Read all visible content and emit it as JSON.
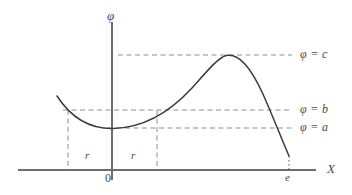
{
  "figure": {
    "background_color": "#ffffff",
    "curve_color": "#3a3a3a",
    "axis_color": "#6d6d6d",
    "guide_color": "#8e8e8e",
    "text_color": "#4a4a4a",
    "width": 352,
    "height": 195
  },
  "axes": {
    "y_axis_label": "φ",
    "x_axis_label": "X",
    "origin_label": "0",
    "x_axis_y": 170,
    "y_axis_x": 112,
    "x_axis_start": 18,
    "x_axis_end": 316,
    "y_axis_top": 22,
    "y_axis_bottom": 180
  },
  "levels": [
    {
      "key": "c",
      "label": "φ = c",
      "y": 55,
      "x_start": 118,
      "x_end": 292,
      "label_x": 300,
      "label_y": 48
    },
    {
      "key": "b",
      "label": "φ = b",
      "y": 110,
      "x_start": 63,
      "x_end": 292,
      "label_x": 300,
      "label_y": 103
    },
    {
      "key": "a",
      "label": "φ = a",
      "y": 128,
      "x_start": 108,
      "x_end": 292,
      "label_x": 300,
      "label_y": 121
    }
  ],
  "verticals": [
    {
      "key": "left-r",
      "x": 68,
      "y_top": 110,
      "y_bottom": 170
    },
    {
      "key": "right-r",
      "x": 157,
      "y_top": 110,
      "y_bottom": 170
    }
  ],
  "tick_labels": [
    {
      "key": "r-left",
      "label": "r",
      "x": 85,
      "y": 155
    },
    {
      "key": "r-right",
      "label": "r",
      "x": 131,
      "y": 155
    }
  ],
  "endpoint": {
    "label": "e",
    "label_x": 284,
    "label_y": 174,
    "drop_x": 289,
    "drop_y_top": 156,
    "drop_y_bottom": 170
  },
  "chart_data": {
    "type": "line",
    "title": "",
    "xlabel": "X",
    "ylabel": "φ",
    "grid": false,
    "legend": "none",
    "annotations": [
      "φ = c",
      "φ = b",
      "φ = a",
      "r",
      "r",
      "0",
      "e"
    ],
    "level_lines": [
      {
        "name": "φ = c",
        "value": "c",
        "screen_y": 55
      },
      {
        "name": "φ = b",
        "value": "b",
        "screen_y": 110
      },
      {
        "name": "φ = a",
        "value": "a",
        "screen_y": 128
      }
    ],
    "curve_path": "M 57 96 C 70 116, 88 129, 113 128.5 C 142 128, 168 114, 192 88 C 208 70, 218 58, 226 55.5 C 238 53, 250 66, 262 92 C 272 114, 282 140, 289 156",
    "features": {
      "local_minimum": {
        "x_screen": 113,
        "y_screen": 128.5,
        "level": "a"
      },
      "local_maximum": {
        "x_screen": 226,
        "y_screen": 55.5,
        "level": "c"
      },
      "left_crossing_of_b": {
        "x_screen": 68,
        "y_screen": 110
      },
      "right_crossing_of_b": {
        "x_screen": 157,
        "y_screen": 110
      },
      "right_endpoint": {
        "x_screen": 289,
        "y_screen": 156,
        "x_label": "e"
      }
    },
    "x_ticks": [
      "r",
      "0",
      "r",
      "e"
    ],
    "y_ticks": [
      "a",
      "b",
      "c"
    ]
  }
}
